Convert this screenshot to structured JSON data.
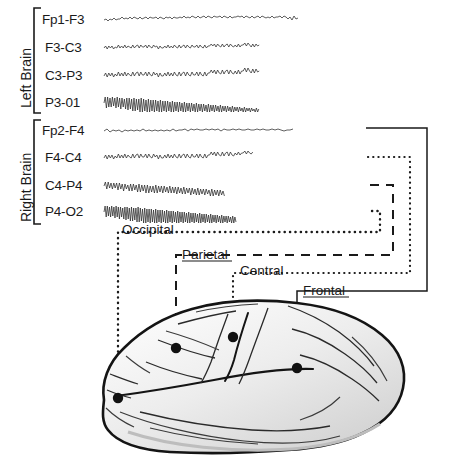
{
  "figure": {
    "view": "left lateral brain, anterior to the right"
  },
  "groups": [
    {
      "name": "left-brain",
      "label": "Left Brain"
    },
    {
      "name": "right-brain",
      "label": "Right Brain"
    }
  ],
  "channels": {
    "left": [
      {
        "label": "Fp1-F3",
        "row_y": 20
      },
      {
        "label": "F3-C3",
        "row_y": 48
      },
      {
        "label": "C3-P3",
        "row_y": 76
      },
      {
        "label": "P3-01",
        "row_y": 103
      }
    ],
    "right": [
      {
        "label": "Fp2-F4",
        "row_y": 131
      },
      {
        "label": "F4-C4",
        "row_y": 158
      },
      {
        "label": "C4-P4",
        "row_y": 186
      },
      {
        "label": "P4-O2",
        "row_y": 212
      }
    ]
  },
  "regions": [
    {
      "name": "occipital",
      "label": "Occipital",
      "line_style": "dotted",
      "electrode": {
        "x": 118,
        "y": 398
      }
    },
    {
      "name": "parietal",
      "label": "Parietal",
      "line_style": "dashed",
      "electrode": {
        "x": 176,
        "y": 348
      }
    },
    {
      "name": "central",
      "label": "Central",
      "line_style": "dotted",
      "electrode": {
        "x": 233,
        "y": 337
      }
    },
    {
      "name": "frontal",
      "label": "Frontal",
      "line_style": "solid",
      "electrode": {
        "x": 297,
        "y": 368
      }
    }
  ],
  "colors": {
    "ink": "#1a1a1a",
    "trace": "#2b2b2b",
    "brain_fill": "#e9e9e9",
    "brain_outline": "#141414",
    "background": "#ffffff"
  }
}
